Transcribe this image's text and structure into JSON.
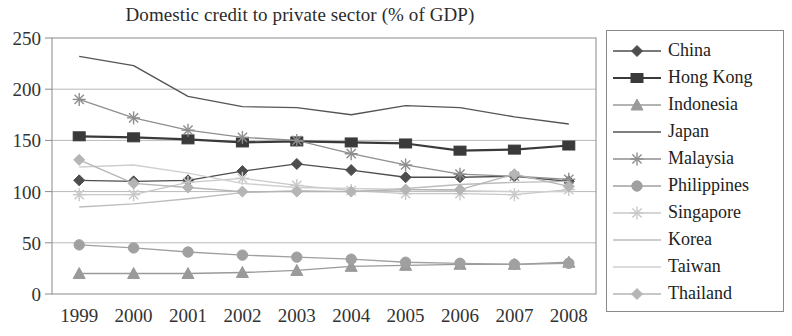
{
  "chart_data": {
    "type": "line",
    "title": "Domestic credit to private sector (% of GDP)",
    "xlabel": "",
    "ylabel": "",
    "categories": [
      "1999",
      "2000",
      "2001",
      "2002",
      "2003",
      "2004",
      "2005",
      "2006",
      "2007",
      "2008"
    ],
    "x": [
      1999,
      2000,
      2001,
      2002,
      2003,
      2004,
      2005,
      2006,
      2007,
      2008
    ],
    "ylim": [
      0,
      250
    ],
    "yticks": [
      0,
      50,
      100,
      150,
      200,
      250
    ],
    "grid": "horizontal",
    "legend_position": "right",
    "series": [
      {
        "name": "China",
        "marker": "diamond",
        "color": "#4d4d4d",
        "values": [
          111,
          110,
          111,
          120,
          127,
          121,
          114,
          114,
          115,
          110
        ]
      },
      {
        "name": "Hong Kong",
        "marker": "square",
        "color": "#3a3a3a",
        "values": [
          154,
          153,
          151,
          148,
          149,
          148,
          147,
          140,
          141,
          145
        ]
      },
      {
        "name": "Indonesia",
        "marker": "triangle",
        "color": "#9a9a9a",
        "values": [
          20,
          20,
          20,
          21,
          23,
          27,
          28,
          29,
          29,
          31
        ]
      },
      {
        "name": "Japan",
        "marker": "none",
        "color": "#555555",
        "values": [
          232,
          223,
          193,
          183,
          182,
          175,
          184,
          182,
          173,
          166
        ]
      },
      {
        "name": "Malaysia",
        "marker": "star",
        "color": "#8e8e8e",
        "values": [
          190,
          172,
          160,
          153,
          150,
          137,
          126,
          117,
          115,
          112
        ]
      },
      {
        "name": "Philippines",
        "marker": "circle",
        "color": "#a0a0a0",
        "values": [
          48,
          45,
          41,
          38,
          36,
          34,
          31,
          30,
          29,
          30
        ]
      },
      {
        "name": "Singapore",
        "marker": "star-faint",
        "color": "#c8c8c8",
        "values": [
          97,
          97,
          109,
          113,
          106,
          101,
          98,
          98,
          97,
          102
        ]
      },
      {
        "name": "Korea",
        "marker": "none",
        "color": "#bdbdbd",
        "values": [
          85,
          88,
          93,
          99,
          101,
          100,
          103,
          107,
          109,
          110
        ]
      },
      {
        "name": "Taiwan",
        "marker": "none",
        "color": "#cfcfcf",
        "values": [
          124,
          126,
          118,
          108,
          104,
          103,
          102,
          101,
          100,
          100
        ]
      },
      {
        "name": "Thailand",
        "marker": "diamond-light",
        "color": "#b5b5b5",
        "values": [
          131,
          108,
          104,
          100,
          100,
          100,
          102,
          102,
          117,
          105
        ]
      }
    ]
  },
  "legend": {
    "items": [
      {
        "label": "China"
      },
      {
        "label": "Hong Kong"
      },
      {
        "label": "Indonesia"
      },
      {
        "label": "Japan"
      },
      {
        "label": "Malaysia"
      },
      {
        "label": "Philippines"
      },
      {
        "label": "Singapore"
      },
      {
        "label": "Korea"
      },
      {
        "label": "Taiwan"
      },
      {
        "label": "Thailand"
      }
    ]
  }
}
